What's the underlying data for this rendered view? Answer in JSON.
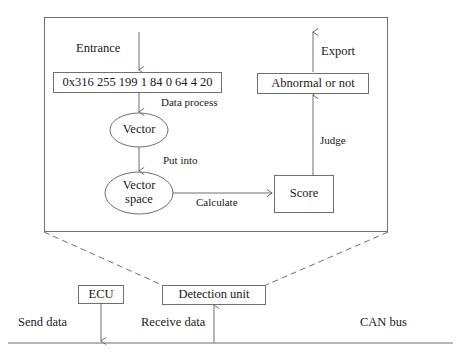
{
  "diagram": {
    "outer_panel": {
      "name": "detection-unit-detail-panel"
    },
    "nodes": {
      "data_frame": {
        "label": "0x316 255 199 1 84 0 64 4 20"
      },
      "vector": {
        "label": "Vector"
      },
      "vector_space_line1": {
        "label": "Vector"
      },
      "vector_space_line2": {
        "label": "space"
      },
      "score": {
        "label": "Score"
      },
      "abnormal": {
        "label": "Abnormal or not"
      },
      "ecu": {
        "label": "ECU"
      },
      "detection_unit": {
        "label": "Detection unit"
      }
    },
    "edge_labels": {
      "entrance": "Entrance",
      "data_process": "Data process",
      "put_into": "Put into",
      "calculate": "Calculate",
      "judge": "Judge",
      "export": "Export",
      "send_data": "Send data",
      "receive_data": "Receive data",
      "can_bus": "CAN bus"
    },
    "colors": {
      "stroke": "#6f6f6f",
      "text": "#1a1a1a",
      "background": "#ffffff"
    }
  }
}
